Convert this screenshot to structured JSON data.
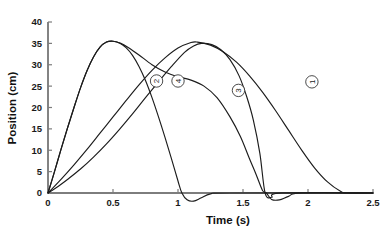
{
  "chart_data": {
    "type": "line",
    "title": "",
    "xlabel": "Time (s)",
    "ylabel": "Position (cm)",
    "xlim": [
      0,
      2.5
    ],
    "ylim": [
      0,
      40
    ],
    "grid": false,
    "legend_position": "inline-markers",
    "xticks": [
      "0",
      "0.5",
      "1",
      "1.5",
      "2",
      "2.5"
    ],
    "xtick_values": [
      0,
      0.5,
      1,
      1.5,
      2,
      2.5
    ],
    "yticks": [
      "0",
      "5",
      "10",
      "15",
      "20",
      "25",
      "30",
      "35",
      "40"
    ],
    "ytick_values": [
      0,
      5,
      10,
      15,
      20,
      25,
      30,
      35,
      40
    ],
    "line_color": "#1c1c1c",
    "axis_color": "#7d7d7d",
    "series": [
      {
        "name": "1",
        "label": "1",
        "marker_label": "1",
        "marker_x": 2.03,
        "marker_y": 26.0,
        "peak_x": 1.15,
        "peak_y": 35.3,
        "x": [
          0,
          0.1,
          0.2,
          0.3,
          0.4,
          0.5,
          0.6,
          0.7,
          0.8,
          0.9,
          1.0,
          1.1,
          1.15,
          1.25,
          1.35,
          1.45,
          1.55,
          1.65,
          1.75,
          1.85,
          1.95,
          2.05,
          2.15,
          2.25,
          2.3,
          2.5
        ],
        "y": [
          0,
          3.2,
          6.6,
          10.2,
          14.0,
          17.8,
          21.6,
          25.3,
          28.7,
          31.6,
          33.9,
          35.2,
          35.3,
          34.6,
          33.0,
          30.6,
          27.4,
          23.6,
          19.3,
          14.7,
          10.1,
          5.9,
          2.6,
          0.4,
          0,
          0
        ]
      },
      {
        "name": "2",
        "label": "2",
        "marker_label": "2",
        "marker_x": 0.835,
        "marker_y": 26.2,
        "peak_x": 0.5,
        "peak_y": 35.5,
        "x": [
          0,
          0.05,
          0.1,
          0.15,
          0.2,
          0.25,
          0.3,
          0.35,
          0.4,
          0.45,
          0.5,
          0.55,
          0.6,
          0.65,
          0.7,
          0.75,
          0.8,
          0.85,
          0.9,
          0.95,
          1.0,
          1.03,
          1.07,
          1.12,
          1.18,
          1.25,
          1.4,
          2.5
        ],
        "y": [
          0,
          5.0,
          10.2,
          15.2,
          20.0,
          24.6,
          28.6,
          31.8,
          34.1,
          35.3,
          35.5,
          35.1,
          34.0,
          32.2,
          29.6,
          26.3,
          22.3,
          17.8,
          13.0,
          8.0,
          2.8,
          0.0,
          -1.6,
          -1.9,
          -1.1,
          -0.2,
          0,
          0
        ]
      },
      {
        "name": "3",
        "label": "3",
        "marker_label": "3",
        "marker_x": 1.465,
        "marker_y": 24.0,
        "peak_x": 1.05,
        "peak_y": 35.2,
        "x": [
          0,
          0.05,
          0.1,
          0.15,
          0.2,
          0.25,
          0.3,
          0.35,
          0.4,
          0.45,
          0.5,
          0.56,
          0.62,
          0.7,
          0.8,
          0.9,
          1.0,
          1.1,
          1.2,
          1.3,
          1.4,
          1.48,
          1.55,
          1.6,
          1.65,
          1.68,
          1.72,
          1.78,
          1.85,
          1.95,
          2.5
        ],
        "y": [
          0,
          5.0,
          10.2,
          15.2,
          20.0,
          24.6,
          28.6,
          31.8,
          34.1,
          35.3,
          35.5,
          35.0,
          34.0,
          32.3,
          30.0,
          28.3,
          27.2,
          26.4,
          25.0,
          22.3,
          17.8,
          13.2,
          8.0,
          4.4,
          0.6,
          0.0,
          -1.5,
          -1.6,
          -0.8,
          0,
          0
        ]
      },
      {
        "name": "4",
        "label": "4",
        "marker_label": "4",
        "marker_x": 1.0,
        "marker_y": 26.2,
        "peak_x": 1.18,
        "peak_y": 35.0,
        "x": [
          0,
          0.08,
          0.16,
          0.25,
          0.35,
          0.45,
          0.55,
          0.65,
          0.75,
          0.85,
          0.95,
          1.05,
          1.12,
          1.18,
          1.26,
          1.33,
          1.4,
          1.47,
          1.53,
          1.58,
          1.63,
          1.67,
          1.72,
          1.8,
          2.5
        ],
        "y": [
          0,
          1.6,
          3.4,
          5.6,
          8.4,
          11.5,
          14.9,
          18.5,
          22.3,
          26.0,
          29.6,
          32.9,
          34.4,
          35.0,
          34.7,
          33.5,
          31.2,
          27.4,
          22.4,
          17.0,
          9.2,
          0.0,
          -1.0,
          0,
          0
        ]
      }
    ]
  }
}
